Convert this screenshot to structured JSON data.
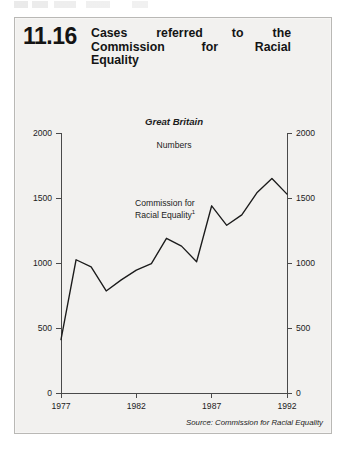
{
  "figure": {
    "number": "11.16",
    "title_lines": [
      "Cases referred to the",
      "Commission for Racial",
      "Equality"
    ],
    "title_full": "Cases referred to the Commission for Racial Equality",
    "source_note": "Source: Commission for Racial Equality"
  },
  "chart_data": {
    "type": "line",
    "title": "Cases referred to the Commission for Racial Equality",
    "subtitle": "Great Britain",
    "region_label": "Great Britain",
    "units_label": "Numbers",
    "xlabel": "",
    "ylabel": "Numbers",
    "grid": false,
    "legend": "inline-annotation",
    "annotations": [
      {
        "text": "Commission for Racial Equality",
        "footnote_marker": "1"
      }
    ],
    "series_label_lines": [
      "Commission for",
      "Racial Equality"
    ],
    "series_footnote_marker": "1",
    "xlim": [
      1977,
      1992
    ],
    "ylim": [
      0,
      2000
    ],
    "xticks": [
      1977,
      1982,
      1987,
      1992
    ],
    "xticklabels": [
      "1977",
      "1982",
      "1987",
      "1992"
    ],
    "yticks": [
      0,
      500,
      1000,
      1500,
      2000
    ],
    "yticklabels_left": [
      "0",
      "500",
      "1000",
      "1500",
      "2000"
    ],
    "yticklabels_right": [
      "0",
      "500",
      "1000",
      "1500",
      "2000"
    ],
    "x": [
      1977,
      1978,
      1979,
      1980,
      1981,
      1982,
      1983,
      1984,
      1985,
      1986,
      1987,
      1988,
      1989,
      1990,
      1991,
      1992
    ],
    "series": [
      {
        "name": "Commission for Racial Equality",
        "values": [
          410,
          1025,
          970,
          785,
          870,
          945,
          995,
          1190,
          1130,
          1010,
          1440,
          1290,
          1370,
          1540,
          1650,
          1530
        ]
      }
    ]
  }
}
